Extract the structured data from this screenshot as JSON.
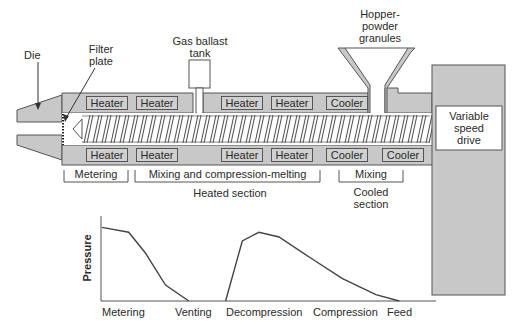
{
  "diagram": {
    "title_labels": {
      "die": "Die",
      "filter_plate_line1": "Filter",
      "filter_plate_line2": "plate",
      "gas_ballast_line1": "Gas ballast",
      "gas_ballast_line2": "tank",
      "hopper_line1": "Hopper-",
      "hopper_line2": "powder",
      "hopper_line3": "granules",
      "drive_line1": "Variable",
      "drive_line2": "speed",
      "drive_line3": "drive"
    },
    "top_elements": [
      {
        "label": "Heater"
      },
      {
        "label": "Heater"
      },
      {
        "label": "Heater"
      },
      {
        "label": "Heater"
      },
      {
        "label": "Cooler"
      }
    ],
    "bottom_elements": [
      {
        "label": "Heater"
      },
      {
        "label": "Heater"
      },
      {
        "label": "Heater"
      },
      {
        "label": "Heater"
      },
      {
        "label": "Cooler"
      },
      {
        "label": "Cooler"
      }
    ],
    "zones": [
      {
        "label": "Metering"
      },
      {
        "label": "Mixing and compression-melting"
      },
      {
        "label": "Mixing"
      }
    ],
    "sections": {
      "heated": "Heated section",
      "cooled_line1": "Cooled",
      "cooled_line2": "section"
    },
    "colors": {
      "housing": "#c8c8c8",
      "outline": "#555555",
      "screw_fill": "#ffffff"
    }
  },
  "chart_data": {
    "type": "line",
    "title": "",
    "xlabel": "",
    "ylabel": "Pressure",
    "categories": [
      "Metering",
      "Venting",
      "Decompression",
      "Compression",
      "Feed"
    ],
    "grid": false,
    "series": [
      {
        "name": "Pressure profile",
        "points_normalized": [
          [
            0.0,
            0.92
          ],
          [
            0.08,
            0.86
          ],
          [
            0.13,
            0.6
          ],
          [
            0.19,
            0.2
          ],
          [
            0.26,
            0.0
          ],
          [
            0.37,
            0.0
          ],
          [
            0.42,
            0.75
          ],
          [
            0.47,
            0.86
          ],
          [
            0.53,
            0.8
          ],
          [
            0.62,
            0.55
          ],
          [
            0.72,
            0.28
          ],
          [
            0.82,
            0.08
          ],
          [
            0.89,
            0.0
          ]
        ]
      }
    ]
  }
}
